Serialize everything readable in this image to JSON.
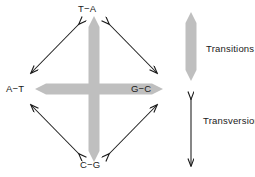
{
  "figure": {
    "title_present": false,
    "background_color": "#ffffff",
    "width": 255,
    "height": 177
  },
  "diagram": {
    "type": "mutation-transition-transversion-diagram",
    "nodes": [
      {
        "id": "top",
        "label": "T−A",
        "position": "top"
      },
      {
        "id": "left",
        "label": "A−T",
        "position": "left"
      },
      {
        "id": "right",
        "label": "G−C",
        "position": "right"
      },
      {
        "id": "bottom",
        "label": "C−G",
        "position": "bottom"
      }
    ],
    "transition_arrows": {
      "style": "thick grey double-headed arrow",
      "color": "#bfbfbf",
      "pairs": [
        {
          "from": "top",
          "to": "bottom",
          "orientation": "vertical"
        },
        {
          "from": "left",
          "to": "right",
          "orientation": "horizontal"
        }
      ]
    },
    "transversion_arrows": {
      "style": "thin black double-headed arrow",
      "color": "#1a1a1a",
      "pairs": [
        {
          "from": "top",
          "to": "left",
          "orientation": "diagonal"
        },
        {
          "from": "top",
          "to": "right",
          "orientation": "diagonal"
        },
        {
          "from": "bottom",
          "to": "left",
          "orientation": "diagonal"
        },
        {
          "from": "bottom",
          "to": "right",
          "orientation": "diagonal"
        }
      ]
    }
  },
  "legend": {
    "items": [
      {
        "id": "transitions",
        "label": "Transitions",
        "symbol": "thick-grey-double-arrow-icon",
        "color": "#bfbfbf"
      },
      {
        "id": "transversions",
        "label": "Transversions",
        "symbol": "thin-black-double-arrow-icon",
        "color": "#1a1a1a"
      }
    ]
  }
}
